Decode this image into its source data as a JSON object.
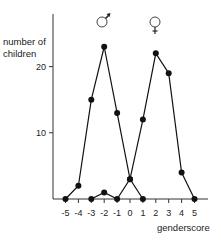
{
  "chart_data": {
    "type": "line",
    "title": "",
    "xlabel": "genderscore",
    "ylabel": "number of children",
    "x": [
      -5,
      -4,
      -3,
      -2,
      -1,
      0,
      1,
      2,
      3,
      4,
      5
    ],
    "x_tick_labels": [
      "-5",
      "-4",
      "-3",
      "-2",
      "-1",
      "0",
      "1",
      "2",
      "3",
      "4",
      "5"
    ],
    "y_ticks": [
      10,
      20
    ],
    "y_tick_labels": [
      "10",
      "20"
    ],
    "ylim": [
      0,
      25
    ],
    "xlim": [
      -6,
      6
    ],
    "grid": false,
    "legend_position": "annotations above peaks",
    "series": [
      {
        "name": "male (♂)",
        "symbol": "♂",
        "x": [
          -5,
          -4,
          -3,
          -2,
          -1,
          0,
          1
        ],
        "values": [
          0,
          2,
          15,
          23,
          13,
          3,
          0
        ]
      },
      {
        "name": "female (♀)",
        "symbol": "♀",
        "x": [
          -3,
          -2,
          -1,
          0,
          1,
          2,
          3,
          4,
          5
        ],
        "values": [
          0,
          1,
          0,
          3,
          12,
          22,
          19,
          4,
          0
        ]
      }
    ],
    "annotations": [
      {
        "text": "♂",
        "near_x": -2
      },
      {
        "text": "♀",
        "near_x": 2
      }
    ]
  },
  "labels": {
    "ylabel_line1": "number of",
    "ylabel_line2": "children",
    "xlabel": "genderscore",
    "male_symbol": "♂",
    "female_symbol": "♀"
  },
  "colors": {
    "line": "#111111",
    "axis": "#333333",
    "background": "#ffffff"
  }
}
